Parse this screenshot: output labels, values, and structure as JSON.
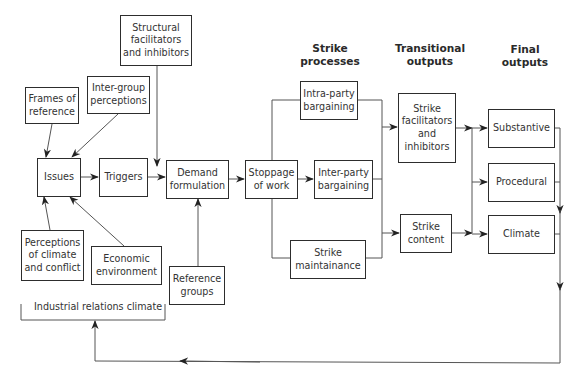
{
  "diagram": {
    "headings": {
      "strike_processes": "Strike\nprocesses",
      "transitional_outputs": "Transitional\noutputs",
      "final_outputs": "Final\noutputs"
    },
    "nodes": {
      "structural_facilitators": "Structural facilitators and inhibitors",
      "frames_of_reference": "Frames of reference",
      "inter_group_perceptions": "Inter-group perceptions",
      "issues": "Issues",
      "triggers": "Triggers",
      "demand_formulation": "Demand formulation",
      "stoppage_of_work": "Stoppage of work",
      "intra_party_bargaining": "Intra-party bargaining",
      "inter_party_bargaining": "Inter-party bargaining",
      "strike_maintainance": "Strike maintainance",
      "strike_facilitators": "Strike facilitators and inhibitors",
      "strike_content": "Strike content",
      "substantive": "Substantive",
      "procedural": "Procedural",
      "climate": "Climate",
      "perceptions_of_climate": "Perceptions of climate and conflict",
      "economic_environment": "Economic environment",
      "reference_groups": "Reference groups"
    },
    "bracket_label": "Industrial relations climate",
    "edges": [
      [
        "frames_of_reference",
        "issues"
      ],
      [
        "inter_group_perceptions",
        "issues"
      ],
      [
        "perceptions_of_climate",
        "issues"
      ],
      [
        "economic_environment",
        "issues"
      ],
      [
        "issues",
        "triggers"
      ],
      [
        "triggers",
        "demand_formulation"
      ],
      [
        "structural_facilitators",
        "demand_formulation"
      ],
      [
        "reference_groups",
        "demand_formulation"
      ],
      [
        "demand_formulation",
        "stoppage_of_work"
      ],
      [
        "stoppage_of_work",
        "intra_party_bargaining"
      ],
      [
        "stoppage_of_work",
        "inter_party_bargaining"
      ],
      [
        "stoppage_of_work",
        "strike_maintainance"
      ],
      [
        "strike_processes",
        "strike_facilitators"
      ],
      [
        "strike_processes",
        "strike_content"
      ],
      [
        "strike_facilitators",
        "substantive"
      ],
      [
        "strike_facilitators",
        "procedural"
      ],
      [
        "strike_facilitators",
        "climate"
      ],
      [
        "strike_content",
        "substantive"
      ],
      [
        "strike_content",
        "procedural"
      ],
      [
        "strike_content",
        "climate"
      ],
      [
        "final_outputs",
        "industrial_relations_climate"
      ]
    ]
  }
}
